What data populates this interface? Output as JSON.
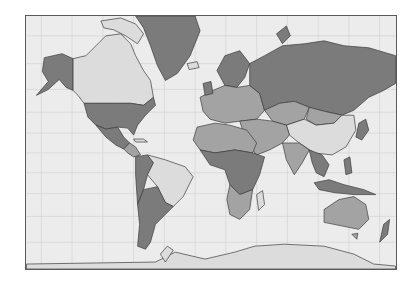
{
  "map": {
    "projection": "mercator",
    "colors": {
      "ocean": "#ececec",
      "grid": "#cfcfcf",
      "border": "#3c3c3c",
      "frame": "#5a5a5a",
      "dark": "#7b7b7b",
      "medium": "#a3a3a3",
      "light": "#dcdcdc"
    },
    "regions": [
      {
        "name": "alaska",
        "shade": "dark"
      },
      {
        "name": "canada",
        "shade": "light"
      },
      {
        "name": "greenland",
        "shade": "dark"
      },
      {
        "name": "united-states",
        "shade": "dark"
      },
      {
        "name": "mexico",
        "shade": "dark"
      },
      {
        "name": "central-america",
        "shade": "medium"
      },
      {
        "name": "brazil",
        "shade": "light"
      },
      {
        "name": "argentina",
        "shade": "dark"
      },
      {
        "name": "andes-west",
        "shade": "dark"
      },
      {
        "name": "russia",
        "shade": "dark"
      },
      {
        "name": "europe",
        "shade": "medium"
      },
      {
        "name": "scandinavia",
        "shade": "dark"
      },
      {
        "name": "kazakhstan",
        "shade": "medium"
      },
      {
        "name": "mongolia",
        "shade": "medium"
      },
      {
        "name": "china",
        "shade": "light"
      },
      {
        "name": "india",
        "shade": "medium"
      },
      {
        "name": "middle-east",
        "shade": "medium"
      },
      {
        "name": "southeast-asia",
        "shade": "dark"
      },
      {
        "name": "indonesia",
        "shade": "dark"
      },
      {
        "name": "africa-north",
        "shade": "medium"
      },
      {
        "name": "africa-central",
        "shade": "dark"
      },
      {
        "name": "africa-south",
        "shade": "medium"
      },
      {
        "name": "madagascar",
        "shade": "light"
      },
      {
        "name": "australia",
        "shade": "medium"
      },
      {
        "name": "new-zealand",
        "shade": "dark"
      },
      {
        "name": "antarctica",
        "shade": "light"
      },
      {
        "name": "japan",
        "shade": "dark"
      }
    ]
  }
}
